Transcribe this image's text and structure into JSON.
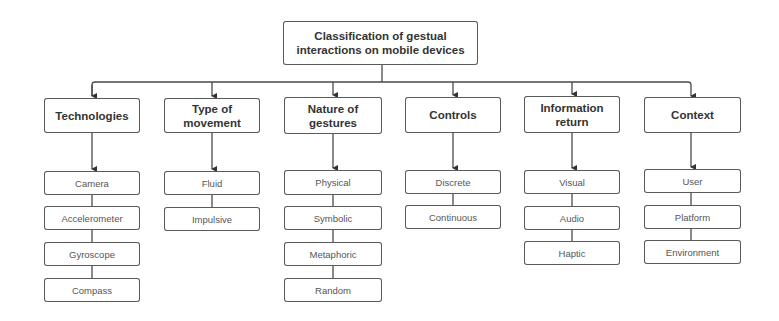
{
  "root": {
    "label": "Classification of gestual interactions on mobile devices",
    "line1": "Classification of gestual",
    "line2": "interactions on mobile devices"
  },
  "categories": [
    {
      "label": "Technologies",
      "line1": "Technologies",
      "line2": "",
      "children": [
        "Camera",
        "Accelerometer",
        "Gyroscope",
        "Compass"
      ]
    },
    {
      "label": "Type of movement",
      "line1": "Type of",
      "line2": "movement",
      "children": [
        "Fluid",
        "Impulsive"
      ]
    },
    {
      "label": "Nature of gestures",
      "line1": "Nature of",
      "line2": "gestures",
      "children": [
        "Physical",
        "Symbolic",
        "Metaphoric",
        "Random"
      ]
    },
    {
      "label": "Controls",
      "line1": "Controls",
      "line2": "",
      "children": [
        "Discrete",
        "Continuous"
      ]
    },
    {
      "label": "Information return",
      "line1": "Information",
      "line2": "return",
      "children": [
        "Visual",
        "Audio",
        "Haptic"
      ]
    },
    {
      "label": "Context",
      "line1": "Context",
      "line2": "",
      "children": [
        "User",
        "Platform",
        "Environment"
      ]
    }
  ],
  "colors": {
    "border": "#5a5a5a",
    "text": "#333333",
    "background": "#ffffff"
  }
}
